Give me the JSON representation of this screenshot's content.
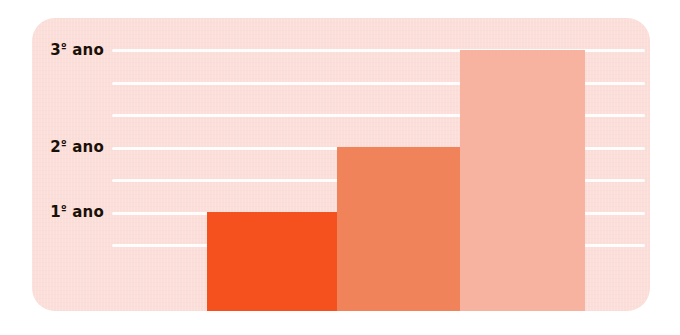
{
  "chart_data": {
    "type": "bar",
    "title": "",
    "subtitle": "",
    "xlabel": "",
    "ylabel": "",
    "orientation": "vertical",
    "grid": true,
    "legend": false,
    "categories": [
      "1º ano",
      "2º ano",
      "3º ano"
    ],
    "values": [
      1,
      2,
      3
    ],
    "ylim": [
      0,
      3.6
    ],
    "y_tick_labels": [
      "1º ano",
      "2º ano",
      "3º ano"
    ],
    "y_tick_values": [
      1,
      2,
      3
    ],
    "series": [
      {
        "name": "crescimento",
        "values": [
          1,
          2,
          3
        ]
      }
    ],
    "bars": [
      {
        "label": "1º ano",
        "value": 1,
        "color": "#f4511e"
      },
      {
        "label": "2º ano",
        "value": 2,
        "color": "#f0835a"
      },
      {
        "label": "3º ano",
        "value": 3,
        "color": "#f8b3a0"
      }
    ],
    "gridline_count": 7,
    "colors": {
      "panel_background": "#fbdfd9",
      "gridline": "#ffffff",
      "page_background": "#ffffff",
      "label_text": "#1a1008",
      "bar_1": "#f4511e",
      "bar_2": "#f0835a",
      "bar_3": "#f8b3a0"
    }
  },
  "axis": {
    "labels": [
      {
        "text": "3º ano",
        "number": "3",
        "ordinal": "º",
        "unit": "ano"
      },
      {
        "text": "2º ano",
        "number": "2",
        "ordinal": "º",
        "unit": "ano"
      },
      {
        "text": "1º ano",
        "number": "1",
        "ordinal": "º",
        "unit": "ano"
      }
    ]
  }
}
